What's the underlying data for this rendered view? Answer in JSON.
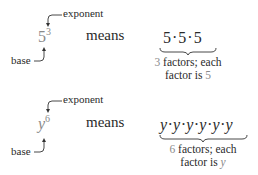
{
  "examples": [
    {
      "base": "5",
      "exponent": "3",
      "exponent_label": "exponent",
      "base_label": "base",
      "means_label": "means",
      "expansion": "5·5·5",
      "note_count": "3",
      "note_line1_rest": " factors; each",
      "note_line2_prefix": "factor is ",
      "note_factor": "5"
    },
    {
      "base": "y",
      "exponent": "6",
      "exponent_label": "exponent",
      "base_label": "base",
      "means_label": "means",
      "expansion": "y·y·y·y·y·y",
      "note_count": "6",
      "note_line1_rest": " factors; each",
      "note_line2_prefix": "factor is ",
      "note_factor": "y"
    }
  ],
  "colors": {
    "text": "#2a2a2a",
    "highlight": "#8a8a8a"
  }
}
